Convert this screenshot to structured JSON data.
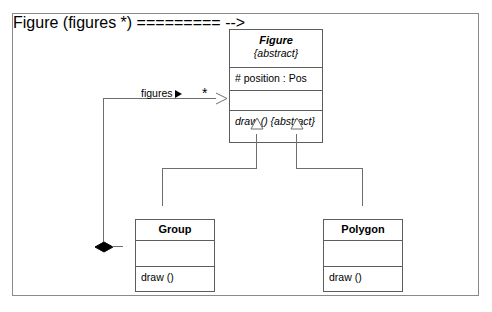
{
  "diagram": {
    "type": "uml-class-diagram",
    "frame": {
      "border_color": "#8a8a8a",
      "background": "#ffffff"
    },
    "classes": [
      {
        "id": "figure",
        "name": "Figure",
        "stereotype": "{abstract}",
        "is_abstract": true,
        "attributes": [
          "# position : Pos"
        ],
        "operations": [
          "draw () {abstract}"
        ],
        "operation_is_abstract": true
      },
      {
        "id": "group",
        "name": "Group",
        "stereotype": "",
        "is_abstract": false,
        "attributes": [
          ""
        ],
        "operations": [
          "draw ()"
        ],
        "operation_is_abstract": false
      },
      {
        "id": "polygon",
        "name": "Polygon",
        "stereotype": "",
        "is_abstract": false,
        "attributes": [
          ""
        ],
        "operations": [
          "draw ()"
        ],
        "operation_is_abstract": false
      }
    ],
    "relationships": [
      {
        "id": "composition-group-figure",
        "kind": "composition",
        "source": "group",
        "target": "figure",
        "role_label": "figures",
        "navigability_marker": "▶",
        "multiplicity": "*",
        "source_marker": "filled-diamond",
        "target_marker": "open-arrow"
      },
      {
        "id": "generalization-group-figure",
        "kind": "generalization",
        "source": "group",
        "target": "figure",
        "target_marker": "hollow-triangle"
      },
      {
        "id": "generalization-polygon-figure",
        "kind": "generalization",
        "source": "polygon",
        "target": "figure",
        "target_marker": "hollow-triangle"
      }
    ],
    "colors": {
      "line": "#6e6e6e",
      "box_border": "#5d5d5d",
      "frame_border": "#8a8a8a",
      "text": "#000000",
      "diamond_fill": "#000000",
      "triangle_fill": "#ffffff"
    }
  }
}
